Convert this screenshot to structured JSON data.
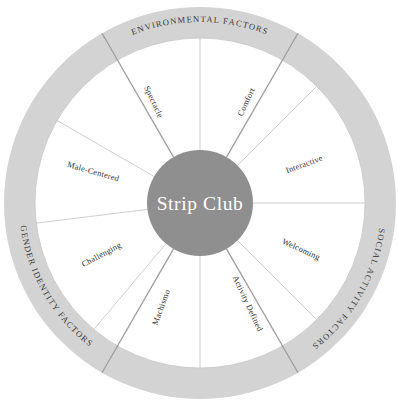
{
  "diagram": {
    "title": "Strip Club",
    "center": {
      "label": "Strip Club",
      "fill_color": "#8f8f8f",
      "text_color": "#ffffff",
      "radius": 53
    },
    "geometry": {
      "cx": 200,
      "cy": 203,
      "outer_radius": 196,
      "ring_inner_radius": 165,
      "ring_band_color": "#d3d3d3",
      "inner_disc_color": "#ffffff",
      "sector_line_color": "#c2c2c2",
      "group_divider_color": "#9d9d9d"
    },
    "outer_rings": [
      {
        "id": "environmental",
        "label": "ENVIRONMENTAL FACTORS",
        "start_angle": -120,
        "end_angle": -60,
        "text_anchor_angle": -90,
        "flip": false
      },
      {
        "id": "social-activity",
        "label": "SOCIAL ACTIVITY FACTORS",
        "start_angle": -60,
        "end_angle": 60,
        "text_anchor_angle": 30,
        "flip": false
      },
      {
        "id": "gender-identity",
        "label": "GENDER IDENTITY FACTORS",
        "start_angle": 120,
        "end_angle": 240,
        "text_anchor_angle": 150,
        "flip": true
      }
    ],
    "sectors": [
      {
        "id": "spectacle",
        "label": "Spectacle",
        "angle": -115,
        "group": "environmental"
      },
      {
        "id": "comfort",
        "label": "Comfort",
        "angle": -65,
        "group": "environmental"
      },
      {
        "id": "interactive",
        "label": "Interactive",
        "angle": -20,
        "group": "social-activity"
      },
      {
        "id": "welcoming",
        "label": "Welcoming",
        "angle": 25,
        "group": "social-activity"
      },
      {
        "id": "activity-defined",
        "label": "Activity Defined",
        "angle": 65,
        "group": "social-activity"
      },
      {
        "id": "machismo",
        "label": "Machismo",
        "angle": 110,
        "group": "gender-identity"
      },
      {
        "id": "challenging",
        "label": "Challenging",
        "angle": 152,
        "group": "gender-identity"
      },
      {
        "id": "male-centered",
        "label": "Male-Centered",
        "angle": 196,
        "group": "gender-identity"
      }
    ],
    "sector_boundaries": [
      -150,
      -90,
      -45,
      0,
      45,
      90,
      130,
      173
    ],
    "group_boundaries": [
      -120,
      -60,
      60,
      120
    ]
  }
}
